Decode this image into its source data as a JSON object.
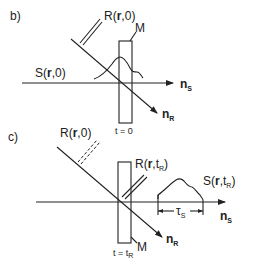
{
  "panels": [
    {
      "id": "b",
      "label": "b)",
      "reference_label": {
        "prefix": "R(",
        "r": "r",
        "sep": ",",
        "arg": "0",
        "suffix": ")"
      },
      "signal_label": {
        "prefix": "S(",
        "r": "r",
        "sep": ",",
        "arg": "0",
        "suffix": ")"
      },
      "mirror_label": "M",
      "time_label": "t = 0",
      "axis_s": {
        "base": "n",
        "sub": "S"
      },
      "axis_r": {
        "base": "n",
        "sub": "R"
      }
    },
    {
      "id": "c",
      "label": "c)",
      "reference_label_past": {
        "prefix": "R(",
        "r": "r",
        "sep": ",",
        "arg": "0",
        "suffix": ")"
      },
      "reference_label": {
        "prefix": "R(",
        "r": "r",
        "sep": ",",
        "arg": "t",
        "arg_sub": "R",
        "suffix": ")"
      },
      "signal_label": {
        "prefix": "S(",
        "r": "r",
        "sep": ",",
        "arg": "t",
        "arg_sub": "R",
        "suffix": ")"
      },
      "mirror_label": "M",
      "time_label": {
        "text": "t = t",
        "sub": "R"
      },
      "duration_label": {
        "base": "τ",
        "sub": "S"
      },
      "axis_s": {
        "base": "n",
        "sub": "S"
      },
      "axis_r": {
        "base": "n",
        "sub": "R"
      }
    }
  ]
}
